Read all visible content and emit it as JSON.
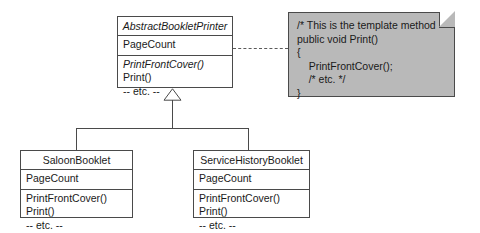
{
  "diagram": {
    "colors": {
      "note_fill": "#b9b9b9",
      "line": "#4a4a4a",
      "background": "#ffffff",
      "text": "#1a1a1a"
    }
  },
  "abstract_class": {
    "name": "AbstractBookletPrinter",
    "is_abstract": true,
    "attributes": [
      {
        "label": "PageCount",
        "is_abstract": false
      }
    ],
    "operations": [
      {
        "label": "PrintFrontCover()",
        "is_abstract": true
      },
      {
        "label": "Print()",
        "is_abstract": false
      },
      {
        "label": "-- etc. --",
        "is_abstract": false
      }
    ]
  },
  "subclasses": [
    {
      "name": "SaloonBooklet",
      "is_abstract": false,
      "attributes": [
        {
          "label": "PageCount",
          "is_abstract": false
        }
      ],
      "operations": [
        {
          "label": "PrintFrontCover()",
          "is_abstract": false
        },
        {
          "label": "Print()",
          "is_abstract": false
        },
        {
          "label": "-- etc. --",
          "is_abstract": false
        }
      ]
    },
    {
      "name": "ServiceHistoryBooklet",
      "is_abstract": false,
      "attributes": [
        {
          "label": "PageCount",
          "is_abstract": false
        }
      ],
      "operations": [
        {
          "label": "PrintFrontCover()",
          "is_abstract": false
        },
        {
          "label": "Print()",
          "is_abstract": false
        },
        {
          "label": "-- etc. --",
          "is_abstract": false
        }
      ]
    }
  ],
  "note": {
    "lines": [
      "/* This is the template method",
      "public void Print()",
      "{",
      "    PrintFrontCover();",
      "    /* etc. */",
      "}"
    ]
  },
  "relationships": {
    "generalization_label": "generalization",
    "note_link_label": "note-anchor-dashed"
  }
}
